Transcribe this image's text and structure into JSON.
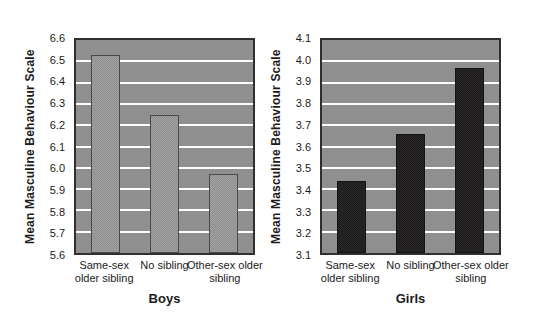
{
  "figure": {
    "panel_background": "#f0ecd9",
    "plot_background": "#8f8f8f",
    "gridline_color": "#ffffff",
    "text_color": "#1b1b1b"
  },
  "chart_data": [
    {
      "type": "bar",
      "title": "Boys",
      "ylabel": "Mean Masculine Behaviour Scale",
      "xlabel": "Boys",
      "categories": [
        "Same-sex older sibling",
        "No sibling",
        "Other-sex older sibling"
      ],
      "values": [
        6.53,
        6.25,
        5.97
      ],
      "ylim": [
        5.6,
        6.6
      ],
      "ytick_step": 0.1,
      "grid": true,
      "legend": false,
      "bar_fill": "#a2a2a2",
      "bar_fill_alt": "#8e8e8e",
      "bar_border": "#4a4a4a"
    },
    {
      "type": "bar",
      "title": "Girls",
      "ylabel": "Mean Masculine Behaviour Scale",
      "xlabel": "Girls",
      "categories": [
        "Same-sex older sibling",
        "No sibling",
        "Other-sex older sibling"
      ],
      "values": [
        3.44,
        3.66,
        3.97
      ],
      "ylim": [
        3.1,
        4.1
      ],
      "ytick_step": 0.1,
      "grid": true,
      "legend": false,
      "bar_fill": "#2b282a",
      "bar_fill_alt": "#1c191b",
      "bar_border": "#151314"
    }
  ]
}
